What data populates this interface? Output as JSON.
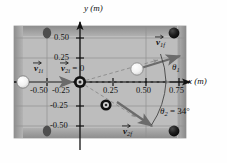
{
  "figure": {
    "type": "physics-vector-diagram"
  },
  "axes": {
    "x_axis_label": "x (m)",
    "y_axis_label": "y (m)",
    "x_ticks": [
      "-0.50",
      "-0.25",
      "0.25",
      "0.50",
      "0.75"
    ],
    "y_ticks": [
      "0.50",
      "0.25",
      "-0.25",
      "-0.50"
    ],
    "x_tick_values": [
      -0.5,
      -0.25,
      0.25,
      0.5,
      0.75
    ],
    "y_tick_values": [
      0.5,
      0.25,
      -0.25,
      -0.5
    ],
    "x_range": [
      -0.75,
      0.85
    ],
    "y_range": [
      -0.62,
      0.62
    ],
    "origin_marker": "target-ball-at-origin"
  },
  "vectors": {
    "v1i": {
      "label": "v",
      "subscript": "1i",
      "description": "incoming cue ball velocity, +x direction"
    },
    "v2i": {
      "label": "v",
      "subscript": "2i",
      "equals": " = 0",
      "description": "target ball initially at rest"
    },
    "v1f": {
      "label": "v",
      "subscript": "1f",
      "description": "cue ball velocity after collision, up and to the right"
    },
    "v2f": {
      "label": "v",
      "subscript": "2f",
      "description": "target ball velocity after collision, down and to the right"
    }
  },
  "angles": {
    "theta1": {
      "symbol": "θ",
      "subscript": "1",
      "text": ""
    },
    "theta2": {
      "symbol": "θ",
      "subscript": "2",
      "text": " = 34°",
      "value": 34,
      "unit": "degrees"
    }
  },
  "balls": [
    {
      "name": "cue-ball-initial",
      "x": -0.655,
      "y": 0.0,
      "fill": "white"
    },
    {
      "name": "cue-ball-final",
      "x": 0.315,
      "y": 0.135,
      "fill": "white"
    },
    {
      "name": "target-ball-origin",
      "x": 0.0,
      "y": 0.0,
      "fill": "ring-dark"
    },
    {
      "name": "target-ball-final",
      "x": 0.195,
      "y": -0.175,
      "fill": "ring-dark"
    }
  ],
  "pockets": [
    {
      "name": "pocket-top-left",
      "x": -0.25,
      "y": 0.5
    },
    {
      "name": "pocket-top-right",
      "x": 0.64,
      "y": 0.5
    },
    {
      "name": "pocket-bottom-left",
      "x": -0.25,
      "y": -0.5
    },
    {
      "name": "pocket-bottom-right",
      "x": 0.64,
      "y": -0.5
    }
  ],
  "colors": {
    "table_felt": "#b9b9b9",
    "table_rail": "#a0a0a0",
    "grid_line": "#8f8f8f",
    "axis": "#111111",
    "vector": "#6b6b6b",
    "dashed": "#8a8a8a",
    "ball_white": "#f6f6f6",
    "ball_dark": "#1a1a1a",
    "text": "#111111"
  }
}
